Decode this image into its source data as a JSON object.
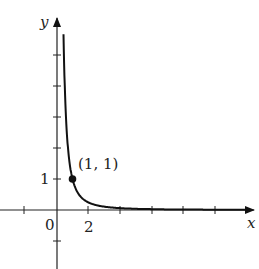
{
  "chart_data": {
    "type": "line",
    "title": "",
    "function": "y = 1/x^2",
    "xlabel": "x",
    "ylabel": "y",
    "x_tick_labels": [
      {
        "value": 0,
        "label": "0"
      },
      {
        "value": 2,
        "label": "2"
      }
    ],
    "y_tick_labels": [
      {
        "value": 1,
        "label": "1"
      }
    ],
    "x_ticks": [
      -4,
      -2,
      0,
      2,
      4,
      6,
      8,
      10
    ],
    "y_ticks": [
      -2,
      1,
      2,
      3,
      4,
      5
    ],
    "xlim": [
      -3.8,
      12.5
    ],
    "ylim": [
      -1.9,
      5
    ],
    "grid": false,
    "annotations": [
      {
        "x": 1,
        "y": 1,
        "label": "(1, 1)",
        "marker": "filled-dot"
      }
    ],
    "series": [
      {
        "name": "1/x^2",
        "x": [
          0.45,
          0.5,
          0.6,
          0.7,
          0.8,
          1,
          1.5,
          2,
          3,
          4,
          6,
          8,
          10,
          11.5
        ],
        "y": [
          4.94,
          4,
          2.78,
          2.04,
          1.56,
          1,
          0.44,
          0.25,
          0.11,
          0.06,
          0.03,
          0.016,
          0.01,
          0.008
        ]
      }
    ]
  },
  "labels": {
    "x_axis": "x",
    "y_axis": "y",
    "origin": "0",
    "x_tick_2": "2",
    "y_tick_1": "1",
    "point": "(1, 1)"
  }
}
